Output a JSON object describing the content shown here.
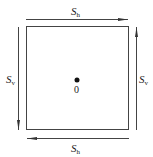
{
  "diagram": {
    "type": "shear-stress-element",
    "center_label": "0",
    "colors": {
      "stroke": "#444444",
      "text": "#222222",
      "background": "#ffffff"
    },
    "labels": {
      "top": {
        "main": "S",
        "sub": "h",
        "direction": "right"
      },
      "bottom": {
        "main": "S",
        "sub": "h",
        "direction": "left"
      },
      "left": {
        "main": "S",
        "sub": "v",
        "direction": "down"
      },
      "right": {
        "main": "S",
        "sub": "v",
        "direction": "up"
      }
    }
  }
}
